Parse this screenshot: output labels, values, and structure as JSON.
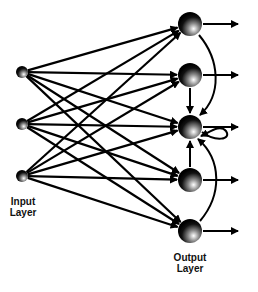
{
  "diagram": {
    "type": "recurrent neural network",
    "input_layer": {
      "label_line1": "Input",
      "label_line2": "Layer",
      "nodes": [
        {
          "id": "i1",
          "x": 22,
          "y": 72
        },
        {
          "id": "i2",
          "x": 22,
          "y": 124
        },
        {
          "id": "i3",
          "x": 22,
          "y": 176
        }
      ]
    },
    "output_layer": {
      "label_line1": "Output",
      "label_line2": "Layer",
      "nodes": [
        {
          "id": "o1",
          "x": 190,
          "y": 24
        },
        {
          "id": "o2",
          "x": 190,
          "y": 75
        },
        {
          "id": "o3",
          "x": 190,
          "y": 127
        },
        {
          "id": "o4",
          "x": 190,
          "y": 180
        },
        {
          "id": "o5",
          "x": 190,
          "y": 231
        }
      ]
    },
    "connections": "fully connected input to output; recurrent feedback from o1, o2, o4, o5 into o3; self-loop on o3",
    "colors": {
      "line": "#000000",
      "background": "#ffffff"
    }
  }
}
